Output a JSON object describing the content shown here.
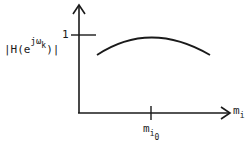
{
  "diagram": {
    "type": "frequency-response-sketch",
    "y_axis_label": {
      "prefix": "|H(e",
      "sup": "jω",
      "sup_sub": "k",
      "suffix": ")|"
    },
    "y_tick_label": "1",
    "x_axis_label": {
      "base": "m",
      "sub": "i"
    },
    "x_tick_label": {
      "base": "m",
      "sub": "i",
      "subsub": "0"
    },
    "curve": {
      "shape": "concave arc peaking at m_i0 just below 1",
      "color": "#1a1a1a"
    },
    "colors": {
      "stroke": "#1a1a1a",
      "background": "#ffffff"
    }
  }
}
